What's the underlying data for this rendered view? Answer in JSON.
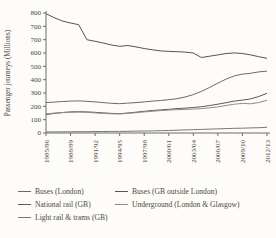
{
  "figure": {
    "y_axis_title": "Passenger journeys (Millions)"
  },
  "chart_data": {
    "type": "line",
    "title": "",
    "xlabel": "",
    "ylabel": "Passenger journeys (Millions)",
    "ylim": [
      0,
      800
    ],
    "grid": false,
    "legend_position": "below",
    "y_tick_labels": [
      "800",
      "700",
      "700",
      "600",
      "500",
      "400",
      "300",
      "200",
      "100",
      "0"
    ],
    "x_tick_labels": [
      "1985/86",
      "1988/89",
      "1991/92",
      "1994/95",
      "1997/98",
      "2000/01",
      "2003/04",
      "2006/07",
      "2009/10",
      "2012/13"
    ],
    "x": [
      "1985/86",
      "1986/87",
      "1987/88",
      "1988/89",
      "1989/90",
      "1990/91",
      "1991/92",
      "1992/93",
      "1993/94",
      "1994/95",
      "1995/96",
      "1996/97",
      "1997/98",
      "1998/99",
      "1999/00",
      "2000/01",
      "2001/02",
      "2002/03",
      "2003/04",
      "2004/05",
      "2005/06",
      "2006/07",
      "2007/08",
      "2008/09",
      "2009/10",
      "2010/11",
      "2011/12",
      "2012/13"
    ],
    "series": [
      {
        "id": "buses_gb_outside_london",
        "name": "Buses (GB outside London)",
        "color": "#57544c",
        "values": [
          795,
          765,
          740,
          725,
          712,
          700,
          688,
          675,
          660,
          650,
          656,
          646,
          634,
          624,
          616,
          612,
          610,
          607,
          600,
          566,
          576,
          586,
          596,
          601,
          596,
          586,
          572,
          560
        ]
      },
      {
        "id": "buses_london",
        "name": "Buses (London)",
        "color": "#6e6a61",
        "values": [
          228,
          232,
          236,
          239,
          241,
          238,
          233,
          228,
          223,
          220,
          224,
          228,
          233,
          239,
          244,
          250,
          257,
          270,
          288,
          312,
          342,
          374,
          404,
          428,
          442,
          448,
          458,
          464
        ]
      },
      {
        "id": "national_rail_gb",
        "name": "National rail (GB)",
        "color": "#5d5a52",
        "values": [
          138,
          147,
          154,
          158,
          160,
          158,
          155,
          151,
          147,
          145,
          150,
          156,
          163,
          169,
          173,
          178,
          183,
          187,
          191,
          197,
          206,
          216,
          227,
          239,
          247,
          256,
          274,
          298
        ]
      },
      {
        "id": "underground_london_glasgow",
        "name": "Underground (London & Glasgow)",
        "color": "#8f8c82",
        "values": [
          143,
          149,
          153,
          156,
          157,
          155,
          151,
          147,
          144,
          143,
          147,
          152,
          158,
          163,
          168,
          172,
          175,
          177,
          179,
          183,
          189,
          196,
          206,
          216,
          222,
          219,
          229,
          245
        ]
      },
      {
        "id": "light_rail_trams_gb",
        "name": "Light rail & trams (GB)",
        "color": "#7b786e",
        "values": [
          8,
          8,
          9,
          9,
          10,
          10,
          11,
          11,
          12,
          12,
          13,
          14,
          15,
          16,
          17,
          19,
          21,
          23,
          25,
          27,
          29,
          31,
          33,
          35,
          36,
          38,
          40,
          43
        ]
      }
    ]
  },
  "legend": {
    "items": [
      {
        "label": "Buses (London)",
        "series": "buses_london"
      },
      {
        "label": "Buses (GB outside London)",
        "series": "buses_gb_outside_london"
      },
      {
        "label": "National rail (GB)",
        "series": "national_rail_gb"
      },
      {
        "label": "Underground (London & Glasgow)",
        "series": "underground_london_glasgow"
      },
      {
        "label": "Light rail & trams (GB)",
        "series": "light_rail_trams_gb"
      }
    ]
  }
}
